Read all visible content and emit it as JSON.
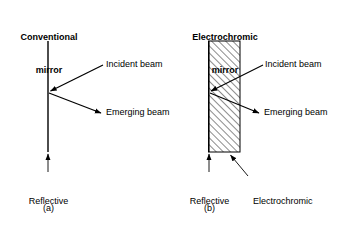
{
  "figure": {
    "background_color": "#ffffff",
    "ink_color": "#000000"
  },
  "panels": [
    {
      "id": "a",
      "title_line1": "Conventional",
      "title_line2": "mirror",
      "caption": "(a)",
      "labels": {
        "incident": "Incident beam",
        "emerging": "Emerging beam",
        "reflective_line1": "Reflective",
        "reflective_line2": "surface"
      }
    },
    {
      "id": "b",
      "title_line1": "Electrochromic",
      "title_line2": "mirror",
      "caption": "(b)",
      "labels": {
        "incident": "Incident beam",
        "emerging": "Emerging beam",
        "reflective_line1": "Reflective",
        "reflective_line2": "surface",
        "layers_line1": "Electrochromic",
        "layers_line2": "layers"
      }
    }
  ]
}
